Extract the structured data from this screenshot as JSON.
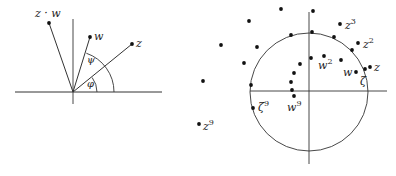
{
  "left_diagram": {
    "origin": [
      73,
      92
    ],
    "x_axis": {
      "x1": 15,
      "x2": 162,
      "y": 92
    },
    "y_axis": {
      "x": 73,
      "y1": 19,
      "y2": 104
    },
    "points": [
      {
        "id": "zw",
        "label": "z · w",
        "x": 49,
        "y": 23,
        "label_x": 35,
        "label_y": 17
      },
      {
        "id": "w",
        "label": "w",
        "x": 90,
        "y": 37,
        "label_x": 94,
        "label_y": 40
      },
      {
        "id": "z",
        "label": "z",
        "x": 132,
        "y": 44,
        "label_x": 136,
        "label_y": 47
      }
    ],
    "arcs": [
      {
        "id": "phi-arc",
        "radius": 24,
        "from_deg": 0,
        "to_deg": 37
      },
      {
        "id": "psi-arc",
        "radius": 41,
        "from_deg": 0,
        "to_deg": 71
      }
    ],
    "angle_labels": [
      {
        "id": "psi",
        "label": "ψ",
        "x": 87,
        "y": 63
      },
      {
        "id": "phi",
        "label": "φ",
        "x": 87,
        "y": 87
      }
    ]
  },
  "right_diagram": {
    "circle": {
      "cx": 309,
      "cy": 92,
      "r": 59
    },
    "x_axis": {
      "x1": 250,
      "x2": 387,
      "y": 91
    },
    "y_axis": {
      "x": 309,
      "y1": 12,
      "y2": 164
    },
    "points": [
      {
        "x": 281,
        "y": 9
      },
      {
        "x": 313,
        "y": 11
      },
      {
        "x": 249,
        "y": 21
      },
      {
        "x": 221,
        "y": 45
      },
      {
        "x": 203,
        "y": 81
      },
      {
        "x": 291,
        "y": 35
      },
      {
        "x": 312,
        "y": 32
      },
      {
        "x": 334,
        "y": 37
      },
      {
        "x": 352,
        "y": 50
      },
      {
        "x": 257,
        "y": 47
      },
      {
        "x": 244,
        "y": 63
      },
      {
        "x": 251,
        "y": 85
      },
      {
        "x": 311,
        "y": 58
      },
      {
        "x": 300,
        "y": 64
      },
      {
        "x": 294,
        "y": 73
      },
      {
        "x": 291,
        "y": 82
      },
      {
        "x": 292,
        "y": 90
      },
      {
        "x": 341,
        "y": 60
      }
    ],
    "labeled_points": [
      {
        "id": "z3",
        "base": "z",
        "sup": "3",
        "x": 340,
        "y": 24,
        "label_x": 345,
        "label_y": 29
      },
      {
        "id": "z2",
        "base": "z",
        "sup": "2",
        "x": 358,
        "y": 43,
        "label_x": 363,
        "label_y": 48
      },
      {
        "id": "z",
        "base": "z",
        "sup": "",
        "x": 370,
        "y": 67,
        "label_x": 374,
        "label_y": 71
      },
      {
        "id": "zeta",
        "base": "ζ",
        "sup": "",
        "x": 365,
        "y": 69,
        "label_x": 360,
        "label_y": 85
      },
      {
        "id": "w",
        "base": "w",
        "sup": "",
        "x": 356,
        "y": 72,
        "label_x": 343,
        "label_y": 76
      },
      {
        "id": "w2",
        "base": "w",
        "sup": "2",
        "x": 324,
        "y": 56,
        "label_x": 318,
        "label_y": 69
      },
      {
        "id": "w9",
        "base": "w",
        "sup": "9",
        "x": 294,
        "y": 96,
        "label_x": 287,
        "label_y": 111
      },
      {
        "id": "zeta9",
        "base": "ζ",
        "sup": "9",
        "x": 253,
        "y": 108,
        "label_x": 258,
        "label_y": 111
      },
      {
        "id": "z9",
        "base": "z",
        "sup": "9",
        "x": 199,
        "y": 124,
        "label_x": 203,
        "label_y": 130
      }
    ]
  }
}
